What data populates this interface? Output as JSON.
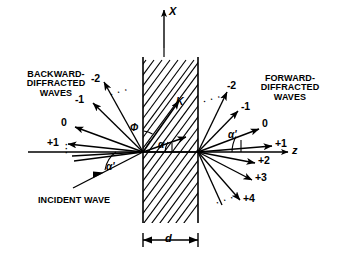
{
  "figure": {
    "axes": {
      "x_axis_label": "X",
      "z_axis_label": "z"
    },
    "regions": {
      "left_label": "BACKWARD-\nDIFFRACTED\nWAVES",
      "right_label": "FORWARD-\nDIFFRACTED\nWAVES",
      "incident_label": "INCIDENT WAVE"
    },
    "backward_orders": [
      "-2",
      "-1",
      "0",
      "+1"
    ],
    "forward_orders_upper": [
      "-2",
      "-1",
      "0"
    ],
    "forward_orders_lower": [
      "+1",
      "+2",
      "+3",
      "+4"
    ],
    "angles": {
      "incident_angle": "α'",
      "forward_angle": "α'",
      "grating_slant_angle": "Φ",
      "internal_angle": "α"
    },
    "vectors": {
      "grating_vector": "K"
    },
    "dimension": {
      "thickness_label": "d"
    },
    "ellipses": {
      "backward_upper": "· · ·",
      "backward_lower": "·\n·\n·",
      "forward_upper": "· · ·",
      "forward_lower": "· · ·"
    },
    "colors": {
      "ink": "#000000",
      "background": "#ffffff"
    }
  }
}
